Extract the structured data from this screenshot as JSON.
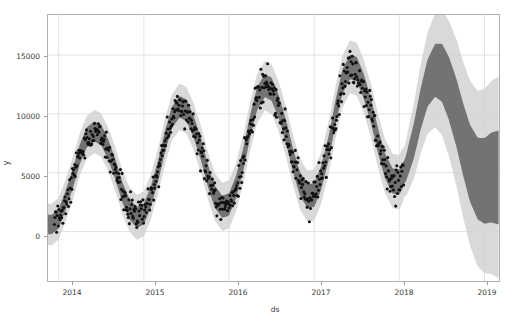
{
  "chart_data": {
    "type": "line",
    "title": "",
    "subtitle": "",
    "xlabel": "ds",
    "ylabel": "y",
    "grid": true,
    "legend_position": "none",
    "xlim": [
      "2013-11-01",
      "2019-02-15"
    ],
    "ylim": [
      -4200,
      18400
    ],
    "xticks": [
      "2014",
      "2015",
      "2016",
      "2017",
      "2018",
      "2019"
    ],
    "xtick_values": [
      2014,
      2015,
      2016,
      2017,
      2018,
      2019
    ],
    "yticks": [
      "0",
      "5000",
      "10000",
      "15000"
    ],
    "ytick_values": [
      0,
      5000,
      10000,
      15000
    ],
    "colors": {
      "observed_points": "#111111",
      "forecast_line": "#5b5b5b",
      "uncertainty_band": "#c9c9c9",
      "gridline": "#e3e3e3",
      "axis": "#b0b0b0",
      "text": "#3a3a3a",
      "background": "#ffffff"
    },
    "series": [
      {
        "name": "yhat",
        "role": "forecast",
        "x": [
          2013.92,
          2014.0,
          2014.08,
          2014.17,
          2014.25,
          2014.33,
          2014.42,
          2014.5,
          2014.58,
          2014.67,
          2014.75,
          2014.83,
          2014.92,
          2015.0,
          2015.08,
          2015.17,
          2015.25,
          2015.33,
          2015.42,
          2015.5,
          2015.58,
          2015.67,
          2015.75,
          2015.83,
          2015.92,
          2016.0,
          2016.08,
          2016.17,
          2016.25,
          2016.33,
          2016.42,
          2016.5,
          2016.58,
          2016.67,
          2016.75,
          2016.83,
          2016.92,
          2017.0,
          2017.08,
          2017.17,
          2017.25,
          2017.33,
          2017.42,
          2017.5,
          2017.58,
          2017.67,
          2017.75,
          2017.83,
          2017.92,
          2018.0,
          2018.08,
          2018.17,
          2018.25,
          2018.33,
          2018.42,
          2018.5,
          2018.58,
          2018.67,
          2018.75,
          2018.83,
          2018.92,
          2019.0,
          2019.08
        ],
        "values": [
          600,
          1100,
          2600,
          4600,
          6600,
          8000,
          8500,
          8200,
          7000,
          5200,
          3300,
          1900,
          1200,
          1500,
          2900,
          5200,
          7700,
          9700,
          10600,
          10300,
          9000,
          7000,
          4800,
          3000,
          2100,
          2300,
          3700,
          6200,
          9000,
          11300,
          12400,
          12100,
          10700,
          8500,
          6100,
          4100,
          3000,
          3100,
          4500,
          7100,
          10100,
          12700,
          14000,
          13800,
          12400,
          10200,
          7700,
          5600,
          4300,
          4200,
          5400,
          7700,
          10400,
          12600,
          13700,
          13500,
          12200,
          10100,
          7800,
          5800,
          4500,
          4300,
          4600
        ]
      },
      {
        "name": "yhat_upper",
        "role": "uncertainty-upper",
        "values_offset_approx": [
          900,
          1000,
          1100,
          1200,
          1300,
          1500,
          1800,
          2200,
          2800,
          3400,
          4000
        ]
      },
      {
        "name": "yhat_lower",
        "role": "uncertainty-lower",
        "values_offset_approx": [
          900,
          1000,
          1100,
          1200,
          1300,
          1500,
          1800,
          2200,
          2800,
          3400,
          4000
        ]
      },
      {
        "name": "observed",
        "role": "scatter",
        "point_count_approx": 620,
        "x_range": [
          2013.95,
          2018.05
        ],
        "y_range": [
          -300,
          16200
        ]
      }
    ],
    "seasonal_peaks": [
      {
        "year": 2014,
        "peak_value": 9200,
        "trough_value": 500
      },
      {
        "year": 2015,
        "peak_value": 11600,
        "trough_value": 1100
      },
      {
        "year": 2016,
        "peak_value": 13800,
        "trough_value": 2000
      },
      {
        "year": 2017,
        "peak_value": 15600,
        "trough_value": 3000
      },
      {
        "year": 2018,
        "peak_value": 14000,
        "trough_value": 4000
      }
    ]
  }
}
